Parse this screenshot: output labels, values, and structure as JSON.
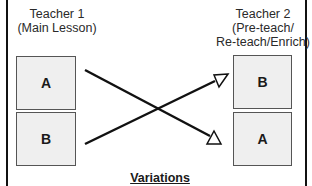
{
  "diagram": {
    "title": "Variations",
    "left_group": {
      "heading_line1": "Teacher 1",
      "heading_line2": "(Main Lesson)",
      "boxes": [
        {
          "label": "A"
        },
        {
          "label": "B"
        }
      ]
    },
    "right_group": {
      "heading_line1": "Teacher 2",
      "heading_line2": "(Pre-teach/",
      "heading_line3": "Re-teach/Enrich)",
      "boxes": [
        {
          "label": "B"
        },
        {
          "label": "A"
        }
      ]
    },
    "connections": [
      {
        "from": "left A",
        "to": "right A",
        "arrowhead": "open-triangle"
      },
      {
        "from": "left B",
        "to": "right B",
        "arrowhead": "open-triangle"
      }
    ],
    "colors": {
      "box_fill": "#efefef",
      "box_border": "#555555",
      "line": "#111111",
      "frame": "#111111"
    }
  }
}
